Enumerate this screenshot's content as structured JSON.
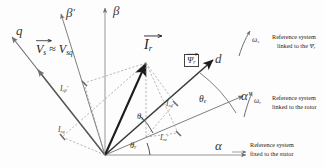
{
  "figure": {
    "type": "vector-diagram",
    "background": "#fdfdfd"
  },
  "axes": [
    {
      "id": "alpha",
      "label": "α",
      "prime": false,
      "angle_deg": 0,
      "frame": "stator"
    },
    {
      "id": "beta",
      "label": "β",
      "prime": false,
      "angle_deg": 90,
      "frame": "stator"
    },
    {
      "id": "alpha-prime",
      "label": "α",
      "prime": true,
      "angle_deg": 23,
      "frame": "rotor"
    },
    {
      "id": "beta-prime",
      "label": "β",
      "prime": true,
      "angle_deg": 113,
      "frame": "rotor"
    },
    {
      "id": "d",
      "label": "d",
      "prime": false,
      "angle_deg": 48,
      "frame": "flux"
    },
    {
      "id": "q",
      "label": "q",
      "prime": false,
      "angle_deg": 138,
      "frame": "flux"
    }
  ],
  "vectors": [
    {
      "id": "rotor-current",
      "label": "I",
      "sub": "r",
      "overbar": true,
      "desc": "rotor current vector"
    },
    {
      "id": "stator-voltage",
      "label": "V",
      "sub": "s",
      "overbar": true,
      "desc": "stator voltage vector"
    },
    {
      "id": "rotor-flux",
      "label": "Ψ",
      "sub": "r",
      "overbar": true,
      "desc": "rotor flux vector",
      "boxed": true
    }
  ],
  "labels": {
    "stator_voltage_relation": {
      "lhs": "V",
      "lhs_sub": "s",
      "approx": "≈",
      "rhs": "V",
      "rhs_sub": "sq"
    },
    "rotor_current": {
      "base": "I",
      "sub": "r"
    },
    "rotor_flux": {
      "base": "Ψ",
      "sub": "r"
    },
    "components": [
      {
        "id": "I-r-beta-prime",
        "base": "I",
        "sub": "rβ",
        "prime": true,
        "desc": "rotor current beta-prime component"
      },
      {
        "id": "I-r-q",
        "base": "I",
        "sub": "rq",
        "prime": false,
        "desc": "rotor current q component"
      },
      {
        "id": "I-r-d",
        "base": "I",
        "sub": "rd",
        "prime": false,
        "desc": "rotor current d component"
      },
      {
        "id": "I-r-alpha-prime",
        "base": "I",
        "sub": "rα",
        "prime": true,
        "desc": "rotor current alpha-prime component"
      }
    ],
    "angles": [
      {
        "id": "theta-s",
        "base": "θ",
        "sub": "s",
        "desc": "slip angle between alpha-prime and d"
      },
      {
        "id": "theta-r",
        "base": "θ",
        "sub": "r",
        "desc": "rotor angle between alpha and alpha-prime"
      },
      {
        "id": "theta-e",
        "base": "θ",
        "sub": "e",
        "desc": "electrical angle between alpha-prime and d arc"
      }
    ],
    "speeds": [
      {
        "id": "omega-s",
        "base": "ω",
        "sub": "s",
        "desc": "synchronous angular speed"
      },
      {
        "id": "omega-r",
        "base": "ω",
        "sub": "r",
        "desc": "rotor angular speed"
      }
    ]
  },
  "annotations": [
    {
      "id": "note-flux-frame",
      "line1": "Reference system",
      "line2_pre": "linked to the ",
      "line2_sym": "Ψ",
      "line2_sub": "r",
      "speed_base": "ω",
      "speed_sub": "s"
    },
    {
      "id": "note-rotor-frame",
      "line1": "Reference system",
      "line2_pre": "linked to the rotor",
      "line2_sym": "",
      "line2_sub": "",
      "speed_base": "ω",
      "speed_sub": "r"
    },
    {
      "id": "note-stator-frame",
      "line1": "Reference system",
      "line2_pre": "fixed to the stator",
      "line2_sym": "",
      "line2_sub": "",
      "speed_base": "",
      "speed_sub": ""
    }
  ],
  "colors": {
    "axis": "#6f6f6f",
    "vector": "#1c1c1c",
    "dashed": "#8c8c8c",
    "text": "#1f1f1f",
    "box": "#444444"
  }
}
